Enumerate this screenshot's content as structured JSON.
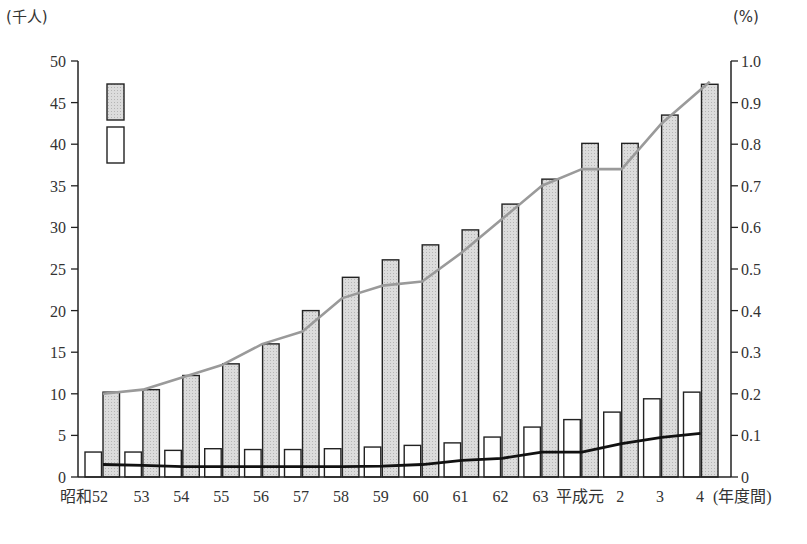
{
  "chart_data": {
    "type": "bar",
    "title": "",
    "xlabel": "(年度間)",
    "ylabel_left": "(千人)",
    "ylabel_right": "(%)",
    "ylim_left": [
      0,
      50
    ],
    "ylim_right": [
      0,
      1.0
    ],
    "yticks_left": [
      0,
      5,
      10,
      15,
      20,
      25,
      30,
      35,
      40,
      45,
      50
    ],
    "yticks_right": [
      "0",
      "0.1",
      "0.2",
      "0.3",
      "0.4",
      "0.5",
      "0.6",
      "0.7",
      "0.8",
      "0.9",
      "1.0"
    ],
    "grid": false,
    "legend_position": "upper-left (unlabeled swatches)",
    "categories": [
      "昭和52",
      "53",
      "54",
      "55",
      "56",
      "57",
      "58",
      "59",
      "60",
      "61",
      "62",
      "63",
      "平成元",
      "2",
      "3",
      "4"
    ],
    "series": [
      {
        "name": "gray-bar",
        "type": "bar",
        "axis": "left",
        "color": "#d4d4d4",
        "values": [
          10.2,
          10.5,
          12.2,
          13.6,
          16.0,
          20.0,
          24.0,
          26.1,
          27.9,
          29.7,
          32.8,
          35.8,
          40.1,
          40.1,
          43.5,
          47.2
        ]
      },
      {
        "name": "white-bar",
        "type": "bar",
        "axis": "left",
        "color": "#ffffff",
        "values": [
          3.0,
          3.0,
          3.2,
          3.4,
          3.3,
          3.3,
          3.4,
          3.6,
          3.8,
          4.1,
          4.8,
          6.0,
          6.9,
          7.8,
          9.4,
          10.2
        ]
      },
      {
        "name": "gray-line",
        "type": "line",
        "axis": "right",
        "color": "#9a9a9a",
        "values": [
          0.2,
          0.21,
          0.24,
          0.27,
          0.32,
          0.35,
          0.43,
          0.46,
          0.47,
          0.54,
          0.62,
          0.7,
          0.74,
          0.74,
          0.85,
          0.95
        ]
      },
      {
        "name": "black-line",
        "type": "line",
        "axis": "right",
        "color": "#111111",
        "values": [
          0.03,
          0.028,
          0.025,
          0.025,
          0.025,
          0.025,
          0.025,
          0.026,
          0.03,
          0.04,
          0.045,
          0.06,
          0.06,
          0.08,
          0.095,
          0.105
        ]
      }
    ]
  },
  "legend": {
    "items": [
      {
        "swatch": "gray",
        "label": ""
      },
      {
        "swatch": "white",
        "label": ""
      }
    ]
  },
  "axes": {
    "left_unit": "(千人)",
    "right_unit": "(%)",
    "x_suffix": "(年度間)"
  }
}
